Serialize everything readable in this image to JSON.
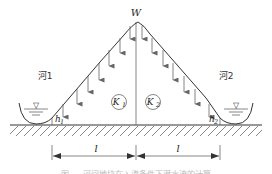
{
  "diagram": {
    "title_top": "W",
    "labels": {
      "river_left": "河1",
      "river_right": "河2",
      "k1": "K",
      "k1_sub": "1",
      "k2": "K",
      "k2_sub": "2",
      "h1": "h",
      "h1_sub": "1",
      "h2": "h",
      "h2_sub": "2",
      "l_left": "l",
      "l_right": "l",
      "water_symbol": "▽"
    },
    "caption": "图 — 河间地块在入渗条件下潜水流的计算",
    "colors": {
      "line": "#333333",
      "arrow": "#666666",
      "hatch": "#555555",
      "background": "#ffffff"
    },
    "recharge_arrows": {
      "left_count": 7,
      "right_count": 7,
      "direction": "down"
    }
  }
}
